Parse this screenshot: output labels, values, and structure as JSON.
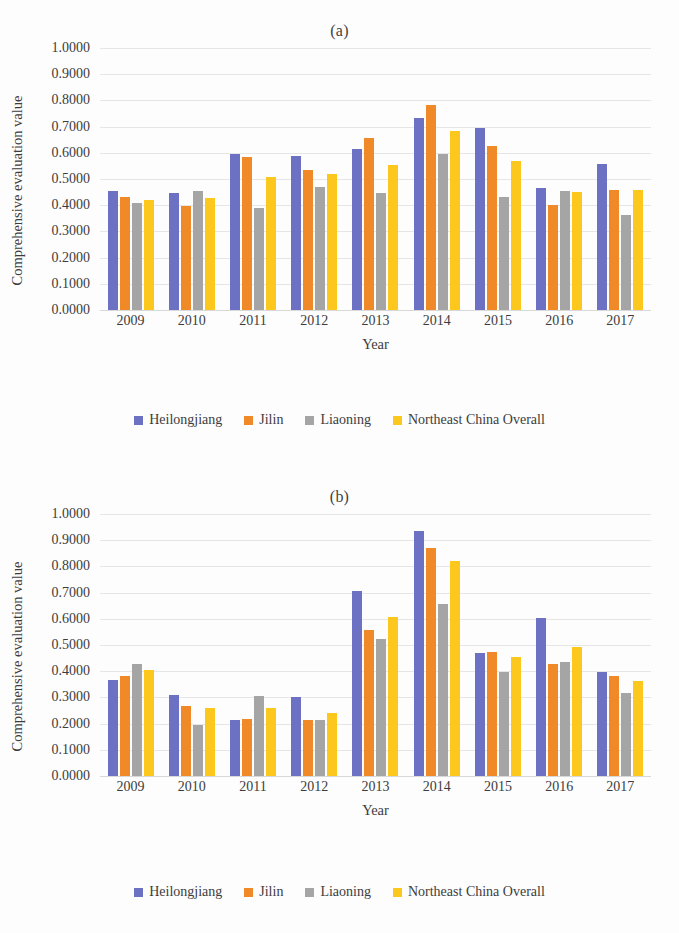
{
  "colors": {
    "heilongjiang": "#6d71c4",
    "jilin": "#f08a28",
    "liaoning": "#a5a5a5",
    "northeast": "#fcc81e",
    "gridline": "#e6e6e6",
    "axis": "#d8d8d8",
    "text": "#3c3c3c"
  },
  "panels": [
    {
      "title": "(a)",
      "ylabel": "Comprehensive evaluation value",
      "xlabel": "Year",
      "yticks": [
        "1.0000",
        "0.9000",
        "0.8000",
        "0.7000",
        "0.6000",
        "0.5000",
        "0.4000",
        "0.3000",
        "0.2000",
        "0.1000",
        "0.0000"
      ],
      "legend": [
        {
          "label": "Heilongjiang",
          "color": "#6d71c4"
        },
        {
          "label": "Jilin",
          "color": "#f08a28"
        },
        {
          "label": "Liaoning",
          "color": "#a5a5a5"
        },
        {
          "label": "Northeast China Overall",
          "color": "#fcc81e"
        }
      ]
    },
    {
      "title": "(b)",
      "ylabel": "Comprehensive evaluation value",
      "xlabel": "Year",
      "yticks": [
        "1.0000",
        "0.9000",
        "0.8000",
        "0.7000",
        "0.6000",
        "0.5000",
        "0.4000",
        "0.3000",
        "0.2000",
        "0.1000",
        "0.0000"
      ],
      "legend": [
        {
          "label": "Heilongjiang",
          "color": "#6d71c4"
        },
        {
          "label": "Jilin",
          "color": "#f08a28"
        },
        {
          "label": "Liaoning",
          "color": "#a5a5a5"
        },
        {
          "label": "Northeast China Overall",
          "color": "#fcc81e"
        }
      ]
    }
  ],
  "chart_data": [
    {
      "type": "bar",
      "title": "(a)",
      "xlabel": "Year",
      "ylabel": "Comprehensive evaluation value",
      "ylim": [
        0,
        1.0
      ],
      "ytick_step": 0.1,
      "grid": true,
      "legend_position": "bottom",
      "categories": [
        "2009",
        "2010",
        "2011",
        "2012",
        "2013",
        "2014",
        "2015",
        "2016",
        "2017"
      ],
      "series": [
        {
          "name": "Heilongjiang",
          "color": "#6d71c4",
          "values": [
            0.456,
            0.445,
            0.596,
            0.586,
            0.615,
            0.733,
            0.693,
            0.465,
            0.558
          ]
        },
        {
          "name": "Jilin",
          "color": "#f08a28",
          "values": [
            0.43,
            0.398,
            0.584,
            0.533,
            0.655,
            0.783,
            0.625,
            0.401,
            0.457
          ]
        },
        {
          "name": "Liaoning",
          "color": "#a5a5a5",
          "values": [
            0.408,
            0.456,
            0.391,
            0.469,
            0.445,
            0.595,
            0.433,
            0.454,
            0.361
          ]
        },
        {
          "name": "Northeast China Overall",
          "color": "#fcc81e",
          "values": [
            0.42,
            0.428,
            0.508,
            0.519,
            0.552,
            0.685,
            0.568,
            0.449,
            0.457
          ]
        }
      ]
    },
    {
      "type": "bar",
      "title": "(b)",
      "xlabel": "Year",
      "ylabel": "Comprehensive evaluation value",
      "ylim": [
        0,
        1.0
      ],
      "ytick_step": 0.1,
      "grid": true,
      "legend_position": "bottom",
      "categories": [
        "2009",
        "2010",
        "2011",
        "2012",
        "2013",
        "2014",
        "2015",
        "2016",
        "2017"
      ],
      "series": [
        {
          "name": "Heilongjiang",
          "color": "#6d71c4",
          "values": [
            0.367,
            0.308,
            0.213,
            0.303,
            0.705,
            0.935,
            0.47,
            0.603,
            0.398
          ]
        },
        {
          "name": "Jilin",
          "color": "#f08a28",
          "values": [
            0.382,
            0.268,
            0.218,
            0.215,
            0.556,
            0.87,
            0.472,
            0.429,
            0.38
          ]
        },
        {
          "name": "Liaoning",
          "color": "#a5a5a5",
          "values": [
            0.428,
            0.193,
            0.305,
            0.212,
            0.522,
            0.658,
            0.398,
            0.436,
            0.316
          ]
        },
        {
          "name": "Northeast China Overall",
          "color": "#fcc81e",
          "values": [
            0.403,
            0.258,
            0.258,
            0.242,
            0.608,
            0.82,
            0.453,
            0.493,
            0.364
          ]
        }
      ]
    }
  ]
}
